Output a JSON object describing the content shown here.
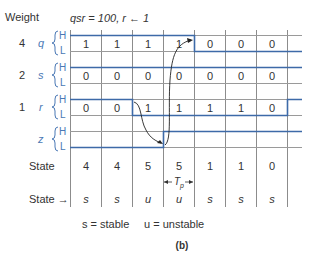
{
  "header": {
    "weight_label": "Weight",
    "condition": "qsr = 100, r ← 1"
  },
  "signals": [
    {
      "name": "q",
      "weight": "4",
      "high": "H",
      "low": "L",
      "values": [
        "1",
        "1",
        "1",
        "1",
        "0",
        "0",
        "0"
      ]
    },
    {
      "name": "s",
      "weight": "2",
      "high": "H",
      "low": "L",
      "values": [
        "0",
        "0",
        "0",
        "0",
        "0",
        "0",
        "0"
      ]
    },
    {
      "name": "r",
      "weight": "1",
      "high": "H",
      "low": "L",
      "values": [
        "0",
        "0",
        "1",
        "1",
        "1",
        "1",
        "0"
      ]
    },
    {
      "name": "z",
      "weight": "",
      "high": "H",
      "low": "L",
      "values": []
    }
  ],
  "state_row": {
    "label": "State",
    "values": [
      "4",
      "4",
      "5",
      "5",
      "1",
      "1",
      "0"
    ]
  },
  "tp_label": "T",
  "tp_sub": "p",
  "stability_row": {
    "label": "State →",
    "values": [
      "s",
      "s",
      "u",
      "u",
      "s",
      "s",
      "s"
    ]
  },
  "legend": {
    "stable": "s = stable",
    "unstable": "u = unstable"
  },
  "caption": "(b)",
  "colors": {
    "signal_line": "#3d6aa8",
    "grid_line": "#8a8a8a",
    "label_blue": "#4a78b5"
  }
}
